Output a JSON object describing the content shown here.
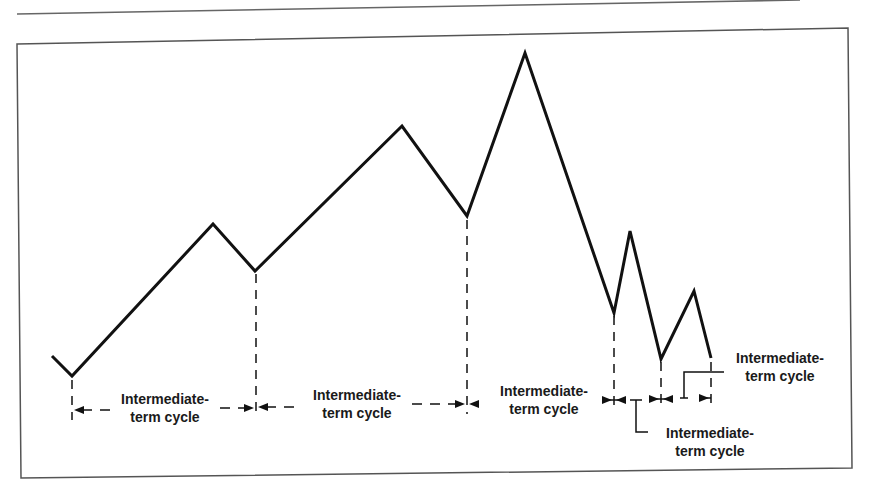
{
  "figure": {
    "title": "",
    "colors": {
      "line": "#111111",
      "frame": "#555555",
      "rule": "#666666",
      "text": "#1a1a1a"
    }
  },
  "path": {
    "points": [
      [
        52,
        356
      ],
      [
        72,
        376
      ],
      [
        213,
        224
      ],
      [
        255,
        271
      ],
      [
        402,
        126
      ],
      [
        467,
        216
      ],
      [
        525,
        53
      ],
      [
        614,
        313
      ],
      [
        630,
        231
      ],
      [
        661,
        359
      ],
      [
        694,
        291
      ],
      [
        711,
        358
      ]
    ]
  },
  "cycle_boundaries_x": [
    72,
    255,
    467,
    614,
    661,
    711
  ],
  "labels": [
    {
      "line1": "Intermediate-",
      "line2": "term cycle"
    },
    {
      "line1": "Intermediate-",
      "line2": "term cycle"
    },
    {
      "line1": "Intermediate-",
      "line2": "term cycle"
    },
    {
      "line1": "Intermediate-",
      "line2": "term cycle"
    },
    {
      "line1": "Intermediate-",
      "line2": "term cycle"
    }
  ]
}
